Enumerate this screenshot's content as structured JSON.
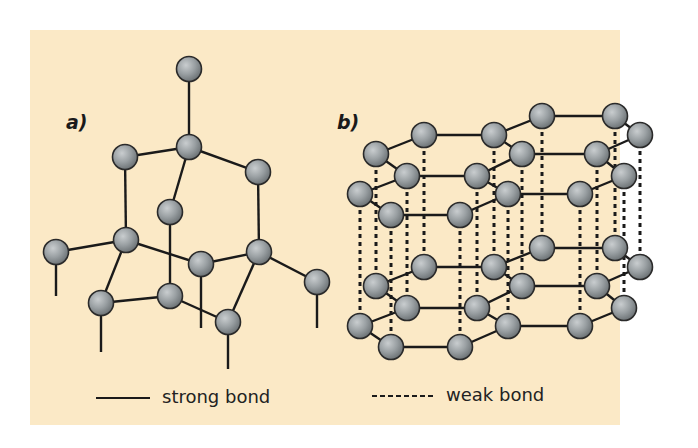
{
  "figure": {
    "background_color": "#fbe9c6",
    "atom_color": "#8e9396",
    "bond_color": "#1a1a1a",
    "panel_a": {
      "label": "a)",
      "structure": "diamond",
      "atoms": [
        {
          "id": "top",
          "x": 189,
          "y": 69
        },
        {
          "id": "c1",
          "x": 189,
          "y": 147
        },
        {
          "id": "lu",
          "x": 125,
          "y": 157
        },
        {
          "id": "ru",
          "x": 258,
          "y": 172
        },
        {
          "id": "mid",
          "x": 170,
          "y": 212
        },
        {
          "id": "l",
          "x": 56,
          "y": 252
        },
        {
          "id": "lm",
          "x": 126,
          "y": 240
        },
        {
          "id": "cl",
          "x": 201,
          "y": 264
        },
        {
          "id": "rm",
          "x": 259,
          "y": 252
        },
        {
          "id": "fr",
          "x": 317,
          "y": 282
        },
        {
          "id": "bl",
          "x": 101,
          "y": 303
        },
        {
          "id": "bc",
          "x": 170,
          "y": 296
        },
        {
          "id": "br",
          "x": 228,
          "y": 322
        }
      ],
      "bonds": [
        [
          "top",
          "c1"
        ],
        [
          "c1",
          "lu"
        ],
        [
          "c1",
          "ru"
        ],
        [
          "c1",
          "mid"
        ],
        [
          "lu",
          "lm"
        ],
        [
          "ru",
          "rm"
        ],
        [
          "mid",
          "bc"
        ],
        [
          "lm",
          "l"
        ],
        [
          "lm",
          "cl"
        ],
        [
          "lm",
          "bl"
        ],
        [
          "rm",
          "cl"
        ],
        [
          "rm",
          "fr"
        ],
        [
          "rm",
          "br"
        ],
        [
          "bl",
          "bc"
        ],
        [
          "bc",
          "br"
        ]
      ],
      "stubs": [
        {
          "x": 56,
          "y1": 265,
          "y2": 296
        },
        {
          "x": 201,
          "y1": 277,
          "y2": 328
        },
        {
          "x": 317,
          "y1": 295,
          "y2": 328
        },
        {
          "x": 101,
          "y1": 316,
          "y2": 352
        },
        {
          "x": 228,
          "y1": 335,
          "y2": 369
        }
      ]
    },
    "panel_b": {
      "label": "b)",
      "structure": "graphite",
      "layer_offsets_y": [
        0,
        132
      ],
      "layers": [
        {
          "atoms": [
            {
              "id": "a1",
              "x": 424,
              "y": 135
            },
            {
              "id": "a2",
              "x": 494,
              "y": 135
            },
            {
              "id": "a3",
              "x": 542,
              "y": 116
            },
            {
              "id": "a4",
              "x": 615,
              "y": 116
            },
            {
              "id": "a5",
              "x": 640,
              "y": 135
            },
            {
              "id": "a6",
              "x": 376,
              "y": 154
            },
            {
              "id": "a7",
              "x": 407,
              "y": 176
            },
            {
              "id": "a8",
              "x": 477,
              "y": 176
            },
            {
              "id": "a9",
              "x": 522,
              "y": 154
            },
            {
              "id": "a10",
              "x": 597,
              "y": 154
            },
            {
              "id": "a11",
              "x": 624,
              "y": 176
            },
            {
              "id": "a12",
              "x": 360,
              "y": 194
            },
            {
              "id": "a13",
              "x": 391,
              "y": 215
            },
            {
              "id": "a14",
              "x": 460,
              "y": 215
            },
            {
              "id": "a15",
              "x": 508,
              "y": 194
            },
            {
              "id": "a16",
              "x": 580,
              "y": 194
            }
          ],
          "bonds": [
            [
              "a1",
              "a2"
            ],
            [
              "a1",
              "a6"
            ],
            [
              "a2",
              "a3"
            ],
            [
              "a3",
              "a4"
            ],
            [
              "a4",
              "a5"
            ],
            [
              "a6",
              "a7"
            ],
            [
              "a2",
              "a9"
            ],
            [
              "a7",
              "a8"
            ],
            [
              "a8",
              "a9"
            ],
            [
              "a9",
              "a10"
            ],
            [
              "a10",
              "a11"
            ],
            [
              "a5",
              "a10"
            ],
            [
              "a7",
              "a12"
            ],
            [
              "a12",
              "a13"
            ],
            [
              "a13",
              "a14"
            ],
            [
              "a14",
              "a15"
            ],
            [
              "a15",
              "a16"
            ],
            [
              "a16",
              "a11"
            ],
            [
              "a8",
              "a15"
            ]
          ]
        }
      ],
      "weak_bond_columns_x": [
        360,
        376,
        391,
        407,
        424,
        460,
        477,
        494,
        508,
        522,
        542,
        580,
        597,
        615,
        624,
        640
      ]
    },
    "legend": {
      "strong": {
        "label": "strong bond",
        "line_style": "solid"
      },
      "weak": {
        "label": "weak bond",
        "line_style": "dashed"
      }
    }
  }
}
